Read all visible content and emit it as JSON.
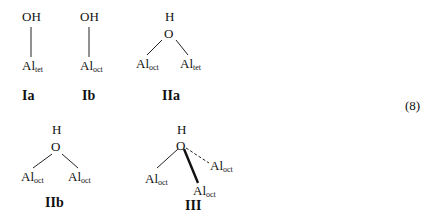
{
  "equation_number": "(8)",
  "structures": [
    {
      "id": "Ia",
      "label": "Ia",
      "top_group": "OH",
      "atoms": [
        {
          "element": "Al",
          "site": "tet"
        }
      ]
    },
    {
      "id": "Ib",
      "label": "Ib",
      "top_group": "OH",
      "atoms": [
        {
          "element": "Al",
          "site": "oct"
        }
      ]
    },
    {
      "id": "IIa",
      "label": "IIa",
      "h": "H",
      "o": "O",
      "atoms": [
        {
          "element": "Al",
          "site": "oct"
        },
        {
          "element": "Al",
          "site": "tet"
        }
      ]
    },
    {
      "id": "IIb",
      "label": "IIb",
      "h": "H",
      "o": "O",
      "atoms": [
        {
          "element": "Al",
          "site": "oct"
        },
        {
          "element": "Al",
          "site": "oct"
        }
      ]
    },
    {
      "id": "III",
      "label": "III",
      "h": "H",
      "o": "O",
      "atoms": [
        {
          "element": "Al",
          "site": "oct"
        },
        {
          "element": "Al",
          "site": "oct"
        },
        {
          "element": "Al",
          "site": "oct"
        }
      ],
      "bond_styles": [
        "plain",
        "bold-wedge",
        "dashed"
      ]
    }
  ]
}
